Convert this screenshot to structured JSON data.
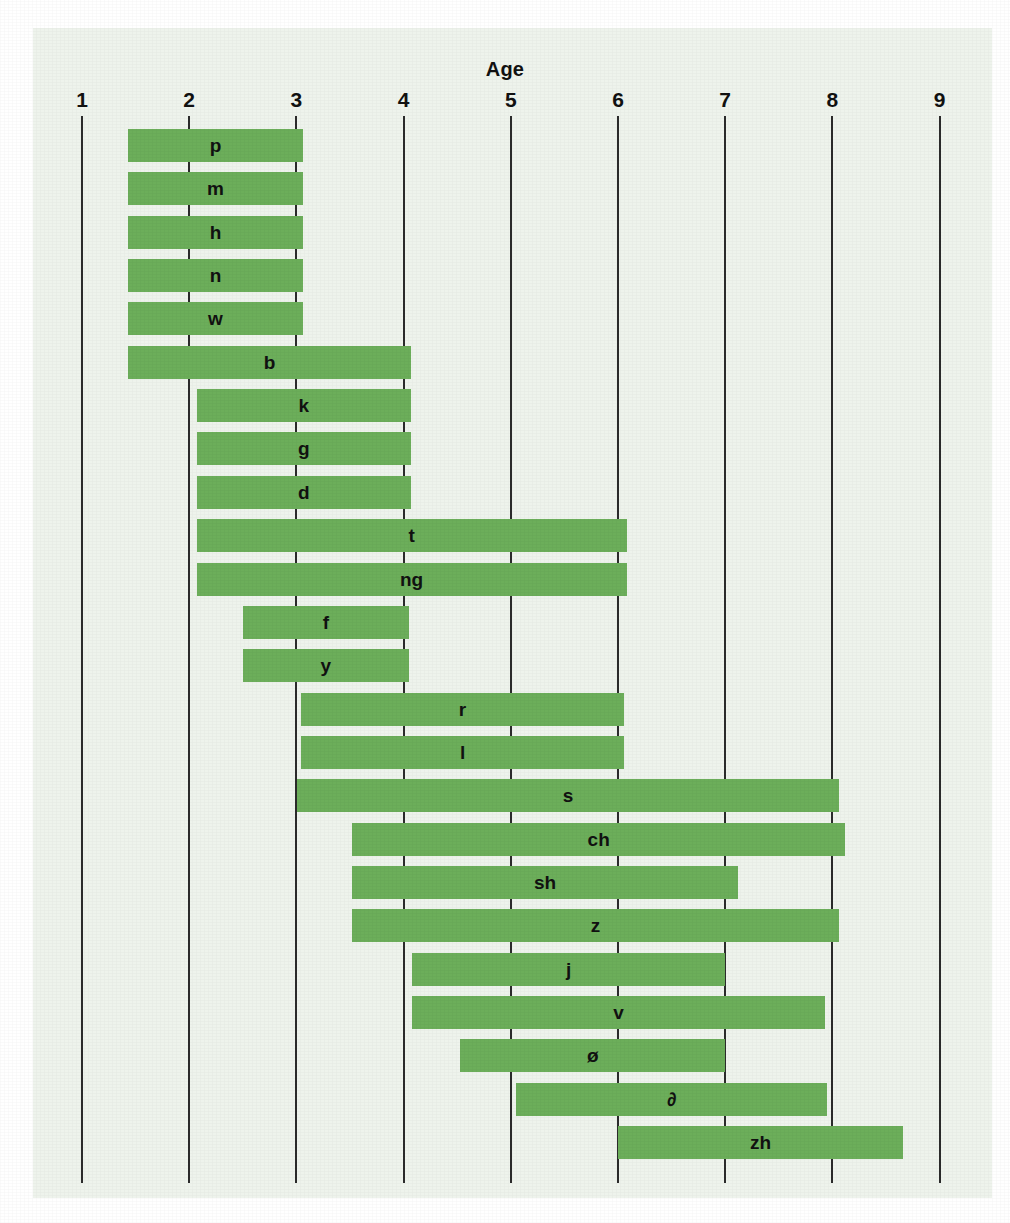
{
  "chart_data": {
    "type": "bar",
    "orientation": "horizontal-range",
    "title": "Age",
    "xlabel": "Age",
    "ylabel": "",
    "xlim": [
      0.6,
      9.4
    ],
    "ticks": [
      1,
      2,
      3,
      4,
      5,
      6,
      7,
      8,
      9
    ],
    "grid": true,
    "legend": false,
    "bar_color": "#6cae5a",
    "panel_color": "#eef3ec",
    "axis_color": "#2b2b2b",
    "text_color": "#111111",
    "categories": [
      "p",
      "m",
      "h",
      "n",
      "w",
      "b",
      "k",
      "g",
      "d",
      "t",
      "ng",
      "f",
      "y",
      "r",
      "l",
      "s",
      "ch",
      "sh",
      "z",
      "j",
      "v",
      "ø",
      "∂",
      "zh"
    ],
    "bars": [
      {
        "label": "p",
        "start": 1.43,
        "end": 3.06
      },
      {
        "label": "m",
        "start": 1.43,
        "end": 3.06
      },
      {
        "label": "h",
        "start": 1.43,
        "end": 3.06
      },
      {
        "label": "n",
        "start": 1.43,
        "end": 3.06
      },
      {
        "label": "w",
        "start": 1.43,
        "end": 3.06
      },
      {
        "label": "b",
        "start": 1.43,
        "end": 4.07
      },
      {
        "label": "k",
        "start": 2.07,
        "end": 4.07
      },
      {
        "label": "g",
        "start": 2.07,
        "end": 4.07
      },
      {
        "label": "d",
        "start": 2.07,
        "end": 4.07
      },
      {
        "label": "t",
        "start": 2.07,
        "end": 6.08
      },
      {
        "label": "ng",
        "start": 2.07,
        "end": 6.08
      },
      {
        "label": "f",
        "start": 2.5,
        "end": 4.05
      },
      {
        "label": "y",
        "start": 2.5,
        "end": 4.05
      },
      {
        "label": "r",
        "start": 3.04,
        "end": 6.06
      },
      {
        "label": "l",
        "start": 3.04,
        "end": 6.06
      },
      {
        "label": "s",
        "start": 3.01,
        "end": 8.06
      },
      {
        "label": "ch",
        "start": 3.52,
        "end": 8.12
      },
      {
        "label": "sh",
        "start": 3.52,
        "end": 7.12
      },
      {
        "label": "z",
        "start": 3.52,
        "end": 8.06
      },
      {
        "label": "j",
        "start": 4.08,
        "end": 7.0
      },
      {
        "label": "v",
        "start": 4.08,
        "end": 7.93
      },
      {
        "label": "ø",
        "start": 4.53,
        "end": 7.0
      },
      {
        "label": "∂",
        "start": 5.05,
        "end": 7.95
      },
      {
        "label": "zh",
        "start": 6.0,
        "end": 8.66
      }
    ]
  },
  "axis": {
    "tick_labels": [
      "1",
      "2",
      "3",
      "4",
      "5",
      "6",
      "7",
      "8",
      "9"
    ]
  },
  "header": {
    "title": "Age"
  }
}
